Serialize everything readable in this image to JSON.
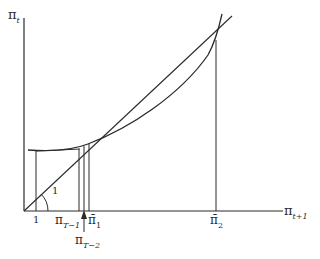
{
  "diagram": {
    "axes": {
      "y_label": "π",
      "y_label_sub": "t",
      "x_label": "π",
      "x_label_sub": "t+1"
    },
    "ticks": {
      "one": "1",
      "pi_T1": "π",
      "pi_T1_sub": "T−1",
      "pi_bar_1": "π̄",
      "pi_bar_1_sub": "1",
      "pi_T2": "π",
      "pi_T2_sub": "T−2",
      "pi_bar_2": "π̄",
      "pi_bar_2_sub": "2"
    },
    "angle_label": "1",
    "colors": {
      "line": "#2a2a2a",
      "background": "#ffffff"
    }
  }
}
